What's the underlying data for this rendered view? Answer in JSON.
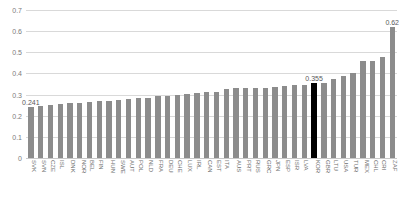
{
  "chart_data": {
    "type": "bar",
    "title": "",
    "subtitle": "",
    "xlabel": "",
    "ylabel": "",
    "ylim": [
      0,
      0.7
    ],
    "ytick_labels": [
      "0.7",
      "0.6",
      "0.5",
      "0.4",
      "0.3",
      "0.2",
      "0.1",
      "0"
    ],
    "ytick_values": [
      0.7,
      0.6,
      0.5,
      0.4,
      0.3,
      0.2,
      0.1,
      0
    ],
    "grid": true,
    "legend": "none",
    "highlight_category": "KOR",
    "highlight_color": "#000000",
    "bar_color": "#8c8c8c",
    "categories": [
      "SVK",
      "SVN",
      "CZE",
      "ISL",
      "DNK",
      "NOR",
      "BEL",
      "FIN",
      "HUN",
      "SWE",
      "AUT",
      "POL",
      "NLD",
      "FRA",
      "DEU",
      "CHE",
      "LUX",
      "IRL",
      "CAN",
      "EST",
      "ITA",
      "AUS",
      "PRT",
      "RUS",
      "GRC",
      "JPN",
      "ESP",
      "ISR",
      "LVA",
      "KOR",
      "GBR",
      "LTU",
      "USA",
      "TUR",
      "MEX",
      "CHL",
      "CRI",
      "ZAF"
    ],
    "values": [
      0.241,
      0.244,
      0.249,
      0.255,
      0.261,
      0.262,
      0.266,
      0.269,
      0.272,
      0.275,
      0.279,
      0.284,
      0.285,
      0.291,
      0.294,
      0.296,
      0.304,
      0.309,
      0.31,
      0.313,
      0.328,
      0.33,
      0.331,
      0.332,
      0.333,
      0.337,
      0.341,
      0.344,
      0.346,
      0.355,
      0.357,
      0.372,
      0.39,
      0.404,
      0.458,
      0.46,
      0.479,
      0.62
    ],
    "annotations": [
      {
        "category": "SVK",
        "label": "0.241"
      },
      {
        "category": "KOR",
        "label": "0.355"
      },
      {
        "category": "ZAF",
        "label": "0.62"
      }
    ]
  }
}
